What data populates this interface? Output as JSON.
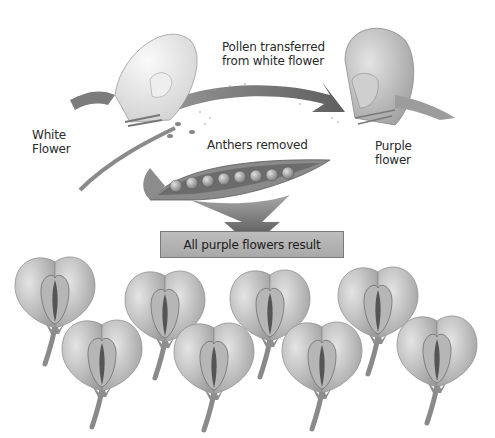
{
  "diagram": {
    "labels": {
      "white_flower": [
        "White",
        "Flower"
      ],
      "purple_flower": [
        "Purple",
        "flower"
      ],
      "pollen_transfer": [
        "Pollen transferred",
        "from white flower"
      ],
      "anthers_removed": "Anthers removed",
      "result": "All purple flowers result"
    },
    "pod": {
      "pea_count": 8
    },
    "offspring": {
      "flower_count": 8,
      "color": "purple"
    },
    "colors": {
      "background": "#ffffff",
      "arrow": "#6e6e6e",
      "pod": "#8c8c8c",
      "result_box": "#b3b3b3",
      "flower_petal": "#c6c6c6"
    }
  }
}
